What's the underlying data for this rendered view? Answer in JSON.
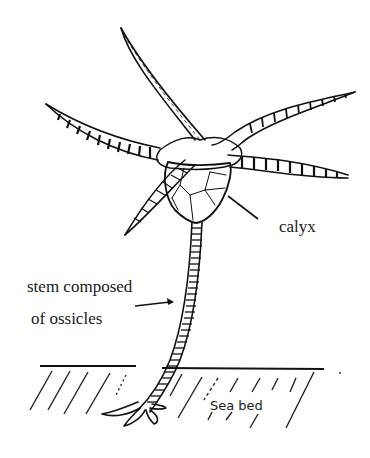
{
  "diagram": {
    "labels": {
      "calyx": "calyx",
      "stem_line1": "stem composed",
      "stem_line2": "of ossicles",
      "seabed": "Sea bed"
    },
    "arms_count": 5,
    "colors": {
      "ink": "#111111",
      "background": "#ffffff",
      "stipple": "#555555"
    }
  }
}
